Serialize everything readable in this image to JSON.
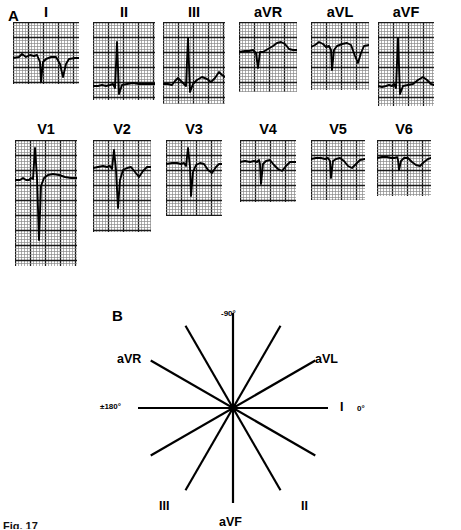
{
  "figure": {
    "panels": [
      {
        "letter": "A",
        "x": 8,
        "y": 8
      },
      {
        "letter": "B",
        "x": 112,
        "y": 308
      }
    ],
    "caption_remnant": "Fig. 17"
  },
  "ecg": {
    "grid": {
      "minor_spacing_px": 3,
      "major_every": 5,
      "minor_color": "#8a8a8a",
      "major_color": "#1a1a1a",
      "trace_color": "#000000"
    },
    "rows": [
      {
        "name": "limb-leads",
        "leads": [
          {
            "label": "I",
            "x": 46,
            "label_y": 5,
            "box_y": 22,
            "w": 66,
            "h": 62,
            "baseline": 0.36,
            "trace": "M0,36 L6,35 L9,32 L13,35 L17,33 L21,34 L24,33 L27,40 L28,60 L30,40 L33,37 L38,35 L43,35 L47,42 L50,55 L53,42 L56,37 L62,36 L66,36"
          },
          {
            "label": "II",
            "x": 124,
            "label_y": 5,
            "box_y": 22,
            "w": 62,
            "h": 78,
            "baseline": 0.78,
            "trace": "M0,64 L5,64 L9,63 L13,64 L17,63 L20,62 L22,66 L24,20 L26,72 L29,63 L34,62 L40,61 L46,62 L52,62 L58,62 L62,62"
          },
          {
            "label": "III",
            "x": 194,
            "label_y": 5,
            "box_y": 22,
            "w": 62,
            "h": 82,
            "baseline": 0.72,
            "trace": "M0,62 L5,62 L9,63 L12,59 L15,56 L18,59 L21,62 L23,64 L25,16 L27,70 L30,62 L34,58 L39,55 L44,57 L48,60 L52,56 L56,50 L59,53 L62,55"
          },
          {
            "label": "aVR",
            "x": 268,
            "label_y": 5,
            "box_y": 22,
            "w": 58,
            "h": 70,
            "baseline": 0.4,
            "trace": "M0,30 L6,29 L10,29 L14,28 L17,31 L19,46 L21,30 L24,30 L29,27 L34,24 L38,21 L42,20 L46,22 L50,27 L54,28 L58,28"
          },
          {
            "label": "aVL",
            "x": 340,
            "label_y": 5,
            "box_y": 22,
            "w": 58,
            "h": 68,
            "baseline": 0.34,
            "trace": "M0,25 L4,23 L8,20 L12,22 L15,25 L18,24 L20,28 L21,48 L23,28 L26,24 L31,22 L36,21 L40,23 L44,34 L47,41 L50,31 L53,24 L58,23"
          },
          {
            "label": "aVF",
            "x": 406,
            "label_y": 5,
            "box_y": 22,
            "w": 56,
            "h": 84,
            "baseline": 0.72,
            "trace": "M0,64 L4,65 L8,64 L11,63 L14,64 L16,62 L18,66 L20,16 L22,72 L25,64 L30,63 L35,62 L40,58 L45,55 L49,58 L53,62 L56,63"
          }
        ]
      },
      {
        "name": "precordial-leads",
        "leads": [
          {
            "label": "V1",
            "x": 46,
            "label_y": 122,
            "box_y": 140,
            "w": 62,
            "h": 126,
            "baseline": 0.31,
            "trace": "M0,40 L5,40 L8,38 L11,40 L14,40 L16,38 L18,39 L20,8 L22,38 L24,100 L26,46 L29,38 L33,35 L38,34 L44,35 L50,37 L56,38 L62,38"
          },
          {
            "label": "V2",
            "x": 122,
            "label_y": 122,
            "box_y": 140,
            "w": 58,
            "h": 92,
            "baseline": 0.28,
            "trace": "M0,28 L5,27 L10,26 L14,27 L17,26 L19,29 L21,10 L23,30 L25,68 L27,40 L30,30 L34,28 L38,27 L42,32 L46,37 L50,31 L54,27 L58,27"
          },
          {
            "label": "V3",
            "x": 194,
            "label_y": 122,
            "box_y": 140,
            "w": 56,
            "h": 76,
            "baseline": 0.3,
            "trace": "M0,24 L6,23 L11,23 L15,24 L18,23 L20,26 L22,8 L24,27 L25,56 L27,32 L30,25 L34,23 L38,24 L42,30 L46,33 L50,27 L53,24 L56,24"
          },
          {
            "label": "V4",
            "x": 268,
            "label_y": 122,
            "box_y": 140,
            "w": 56,
            "h": 62,
            "baseline": 0.35,
            "trace": "M0,22 L5,21 L10,22 L14,21 L17,22 L19,20 L20,24 L21,44 L23,24 L26,21 L30,20 L34,25 L38,29 L42,31 L46,26 L50,22 L56,22"
          },
          {
            "label": "V5",
            "x": 338,
            "label_y": 122,
            "box_y": 140,
            "w": 54,
            "h": 60,
            "baseline": 0.32,
            "trace": "M0,19 L5,18 L10,18 L14,19 L17,18 L19,21 L20,38 L22,21 L25,19 L29,18 L33,21 L37,26 L41,28 L45,24 L49,20 L54,19"
          },
          {
            "label": "V6",
            "x": 404,
            "label_y": 122,
            "box_y": 140,
            "w": 54,
            "h": 56,
            "baseline": 0.33,
            "trace": "M0,18 L5,17 L10,17 L14,18 L18,18 L20,17 L21,20 L22,30 L24,21 L27,18 L31,18 L35,22 L39,25 L43,26 L47,22 L51,19 L54,18"
          }
        ]
      }
    ]
  },
  "hexaxial": {
    "center": {
      "x": 133,
      "y": 108
    },
    "radius": 95,
    "line_color": "#000000",
    "axes": [
      {
        "name": "I",
        "angle_deg": 0,
        "label": "I",
        "label_x": 240,
        "label_y": 101
      },
      {
        "name": "II",
        "angle_deg": 60,
        "label": "II",
        "label_x": 201,
        "label_y": 200
      },
      {
        "name": "III",
        "angle_deg": 120,
        "label": "III",
        "label_x": 59,
        "label_y": 200
      },
      {
        "name": "aVR",
        "angle_deg": -150,
        "label": "aVR",
        "label_x": 17,
        "label_y": 53
      },
      {
        "name": "aVL",
        "angle_deg": -30,
        "label": "aVL",
        "label_x": 215,
        "label_y": 53
      },
      {
        "name": "aVF",
        "angle_deg": 90,
        "label": "aVF",
        "label_x": 119,
        "label_y": 216
      }
    ],
    "degree_labels": [
      {
        "text": "-90°",
        "x": 121,
        "y": 10
      },
      {
        "text": "0°",
        "x": 257,
        "y": 105
      },
      {
        "text": "±180°",
        "x": 0,
        "y": 103
      },
      {
        "text": "+90°",
        "x": 121,
        "y": 234
      }
    ]
  }
}
